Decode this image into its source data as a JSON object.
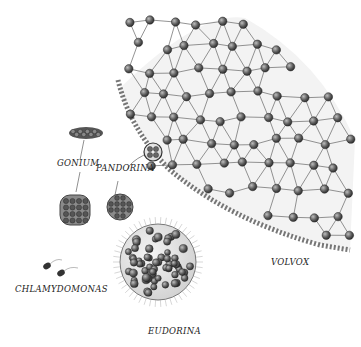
{
  "illustration": {
    "subject": "Colonial green algae evolutionary series",
    "labels": {
      "gonium": "GONIUM",
      "pandorina": "PANDORINA",
      "chlamydomonas": "CHLAMYDOMONAS",
      "eudorina": "EUDORINA",
      "volvox": "VOLVOX"
    },
    "colors": {
      "cell_dark": "#3a3a3a",
      "cell_mid": "#6e6e6e",
      "lattice": "#555555",
      "sheath": "#d8d8d8",
      "background": "#ffffff"
    }
  }
}
